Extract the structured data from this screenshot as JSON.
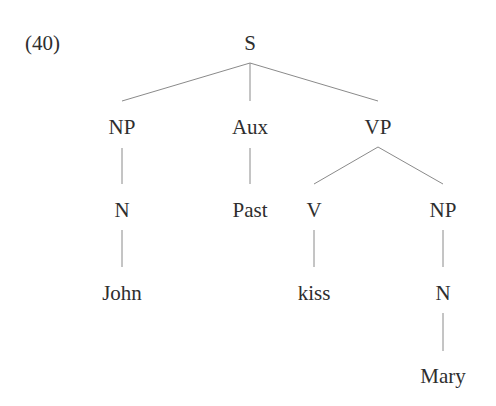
{
  "example_number": "(40)",
  "tree": {
    "root": "S",
    "nodes": {
      "s": "S",
      "np_subject": "NP",
      "aux": "Aux",
      "vp": "VP",
      "n_subject": "N",
      "past": "Past",
      "v": "V",
      "np_object": "NP",
      "john": "John",
      "kiss": "kiss",
      "n_object": "N",
      "mary": "Mary"
    },
    "structure": "[S [NP [N John]] [Aux Past] [VP [V kiss] [NP [N Mary]]]]"
  },
  "colors": {
    "text": "#2e2e2e",
    "lines": "#8a8a8a",
    "background": "#ffffff"
  }
}
